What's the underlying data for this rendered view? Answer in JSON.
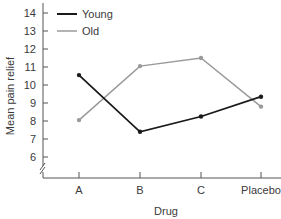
{
  "chart_data": {
    "type": "line",
    "title": "",
    "xlabel": "Drug",
    "ylabel": "Mean pain relief",
    "categories": [
      "A",
      "B",
      "C",
      "Placebo"
    ],
    "series": [
      {
        "name": "Young",
        "color": "#1a1a1a",
        "values": [
          10.55,
          7.4,
          8.25,
          9.35
        ]
      },
      {
        "name": "Old",
        "color": "#9a9a9a",
        "values": [
          8.05,
          11.05,
          11.5,
          8.8
        ]
      }
    ],
    "yticks": [
      6,
      7,
      8,
      9,
      10,
      11,
      12,
      13,
      14
    ],
    "ylim": [
      5,
      14.5
    ],
    "y_axis_break": true,
    "grid": false,
    "legend_position": "upper-left",
    "markers": "dot"
  }
}
